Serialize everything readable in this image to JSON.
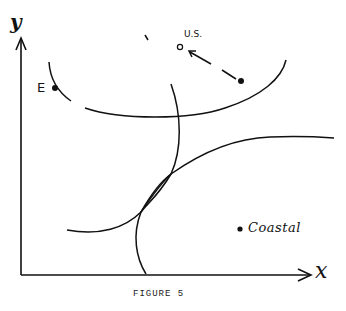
{
  "figure": {
    "caption": "FIGURE 5",
    "axes": {
      "y_label": "y",
      "x_label": "x"
    },
    "points": [
      {
        "label": "E",
        "style": "filled",
        "x": 55,
        "y": 88
      },
      {
        "label": "U.S.",
        "style": "open",
        "x": 180,
        "y": 47
      },
      {
        "label": "",
        "style": "filled",
        "x": 241,
        "y": 81
      },
      {
        "label": "Coastal",
        "style": "filled",
        "x": 240,
        "y": 229
      }
    ],
    "arrow": {
      "from": "filled point",
      "to": "U.S.",
      "style": "dashed"
    },
    "curves": [
      {
        "name": "upper-u-curve",
        "style": "broken/dashed at left"
      },
      {
        "name": "vertical-curve",
        "style": "solid"
      },
      {
        "name": "lower-rising-curve",
        "style": "solid"
      }
    ]
  }
}
